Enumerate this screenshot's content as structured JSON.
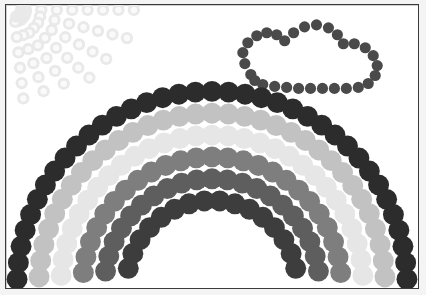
{
  "artwork": {
    "title": "Dotted Rainbow Scene",
    "medium": "circle-stipple drawing",
    "canvas": {
      "width": 426,
      "height": 295
    },
    "background_color": "#ffffff",
    "paper_color": "#f4f4f4",
    "frame": {
      "border_color": "#3a3a3a",
      "border_width": 1,
      "x": 5,
      "y": 4,
      "width": 414,
      "height": 285
    }
  },
  "objects": {
    "rainbow": {
      "name": "rainbow-arc-group",
      "center_x": 213,
      "center_y": 288,
      "dot_radius": 10.5,
      "band_count": 6,
      "bands": [
        {
          "index": 1,
          "name": "band-outer-dark",
          "color": "#2c2c2c",
          "radius": 196,
          "dot_count": 37,
          "start_angle": 182,
          "end_angle": 358
        },
        {
          "index": 2,
          "name": "band-light-gray",
          "color": "#c2c2c2",
          "radius": 174,
          "dot_count": 33,
          "start_angle": 183,
          "end_angle": 357
        },
        {
          "index": 3,
          "name": "band-very-light",
          "color": "#e6e6e6",
          "radius": 152,
          "dot_count": 29,
          "start_angle": 184,
          "end_angle": 356
        },
        {
          "index": 4,
          "name": "band-medium-gray",
          "color": "#7e7e7e",
          "radius": 130,
          "dot_count": 25,
          "start_angle": 186,
          "end_angle": 354
        },
        {
          "index": 5,
          "name": "band-dark-gray",
          "color": "#5e5e5e",
          "radius": 108,
          "dot_count": 21,
          "start_angle": 188,
          "end_angle": 352
        },
        {
          "index": 6,
          "name": "band-inner-darkest",
          "color": "#3d3d3d",
          "radius": 86,
          "dot_count": 16,
          "start_angle": 192,
          "end_angle": 348
        }
      ]
    },
    "sun": {
      "name": "sun-with-rays",
      "color": "#e9e9e9",
      "ring_color": "#f4f4f4",
      "origin_x": 14,
      "origin_y": 10,
      "dot_radius": 6.2,
      "ray_count": 7,
      "description": "faint pale-gray stippled sun rays radiating from the upper-left corner",
      "rays": [
        {
          "angle": 0,
          "dots": 8,
          "spacing": 15.5
        },
        {
          "angle": 14,
          "dots": 8,
          "spacing": 15.0
        },
        {
          "angle": 28,
          "dots": 7,
          "spacing": 15.5
        },
        {
          "angle": 42,
          "dots": 7,
          "spacing": 15.0
        },
        {
          "angle": 56,
          "dots": 6,
          "spacing": 15.5
        },
        {
          "angle": 70,
          "dots": 6,
          "spacing": 15.0
        },
        {
          "angle": 84,
          "dots": 6,
          "spacing": 15.5
        }
      ],
      "core": {
        "dots": 5,
        "radius": 14
      }
    },
    "cloud": {
      "name": "cloud-outline",
      "color": "#4a4a4a",
      "dot_radius": 5.6,
      "description": "dark gray dotted outline of a cloud in the upper right",
      "outline_points": [
        [
          252,
          75
        ],
        [
          246,
          64
        ],
        [
          244,
          53
        ],
        [
          249,
          43
        ],
        [
          258,
          36
        ],
        [
          268,
          33
        ],
        [
          278,
          35
        ],
        [
          286,
          41
        ],
        [
          295,
          33
        ],
        [
          306,
          27
        ],
        [
          318,
          25
        ],
        [
          330,
          28
        ],
        [
          339,
          35
        ],
        [
          345,
          44
        ],
        [
          356,
          44
        ],
        [
          367,
          48
        ],
        [
          375,
          56
        ],
        [
          379,
          66
        ],
        [
          377,
          76
        ],
        [
          370,
          84
        ],
        [
          360,
          88
        ],
        [
          348,
          89
        ],
        [
          336,
          89
        ],
        [
          324,
          89
        ],
        [
          312,
          89
        ],
        [
          300,
          89
        ],
        [
          288,
          88
        ],
        [
          276,
          87
        ],
        [
          264,
          85
        ],
        [
          256,
          81
        ]
      ]
    }
  },
  "palette": {
    "dark": "#2c2c2c",
    "light_gray": "#c2c2c2",
    "very_light": "#e6e6e6",
    "medium_gray": "#7e7e7e",
    "dark_gray": "#5e5e5e",
    "darkest_inner": "#3d3d3d",
    "cloud": "#4a4a4a",
    "sun": "#e9e9e9",
    "frame": "#3a3a3a",
    "background": "#ffffff"
  }
}
